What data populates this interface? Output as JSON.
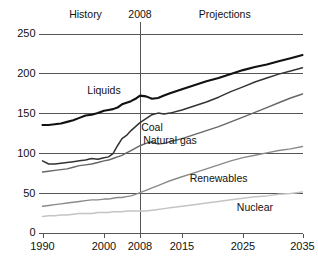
{
  "chart_data": {
    "type": "line",
    "title": "",
    "xlabel": "",
    "ylabel": "",
    "xlim": [
      1990,
      2035
    ],
    "ylim": [
      0,
      250
    ],
    "grid": true,
    "legend_position": "inline-series-labels",
    "xticks": [
      1990,
      2000,
      2008,
      2015,
      2025,
      2035
    ],
    "xtick_labels": [
      "1990",
      "2000",
      "2008",
      "2015",
      "2025",
      "2035"
    ],
    "yticks": [
      0,
      50,
      100,
      150,
      200,
      250
    ],
    "ytick_labels": [
      "0",
      "50",
      "100",
      "150",
      "200",
      "250"
    ],
    "annotations": [
      {
        "text": "History",
        "x": 1997,
        "position": "top"
      },
      {
        "text": "2008",
        "x": 2008,
        "position": "top"
      },
      {
        "text": "Projections",
        "x": 2022,
        "position": "top"
      }
    ],
    "divider_year": 2008,
    "series": [
      {
        "name": "Liquids",
        "color": "#111111",
        "width": 2.1,
        "label_x": 2000,
        "label_y": 178,
        "x": [
          1990,
          1991,
          1992,
          1993,
          1994,
          1995,
          1996,
          1997,
          1998,
          1999,
          2000,
          2001,
          2002,
          2003,
          2004,
          2005,
          2006,
          2007,
          2008,
          2009,
          2010,
          2011,
          2012,
          2013,
          2015,
          2017,
          2019,
          2021,
          2023,
          2025,
          2027,
          2029,
          2031,
          2033,
          2035
        ],
        "values": [
          135,
          135,
          136,
          137,
          139,
          141,
          144,
          147,
          148,
          150,
          153,
          154,
          155,
          157,
          161,
          163,
          165,
          168,
          172,
          171,
          168,
          169,
          172,
          175,
          180,
          185,
          190,
          194,
          199,
          204,
          208,
          211,
          215,
          219,
          223
        ]
      },
      {
        "name": "Coal",
        "color": "#333333",
        "width": 1.5,
        "label_x": 2010,
        "label_y": 132,
        "x": [
          1990,
          1991,
          1992,
          1993,
          1994,
          1995,
          1996,
          1997,
          1998,
          1999,
          2000,
          2001,
          2002,
          2003,
          2004,
          2005,
          2006,
          2007,
          2008,
          2009,
          2010,
          2011,
          2012,
          2013,
          2015,
          2017,
          2019,
          2021,
          2023,
          2025,
          2027,
          2029,
          2031,
          2033,
          2035
        ],
        "values": [
          90,
          86,
          86,
          87,
          88,
          89,
          90,
          91,
          93,
          92,
          94,
          95,
          99,
          109,
          118,
          122,
          128,
          133,
          138,
          143,
          148,
          150,
          149,
          150,
          154,
          159,
          164,
          170,
          177,
          183,
          189,
          194,
          199,
          203,
          207
        ]
      },
      {
        "name": "Natural gas",
        "color": "#666666",
        "width": 1.4,
        "label_x": 2013,
        "label_y": 116,
        "x": [
          1990,
          1991,
          1992,
          1993,
          1994,
          1995,
          1996,
          1997,
          1998,
          1999,
          2000,
          2001,
          2002,
          2003,
          2004,
          2005,
          2006,
          2007,
          2008,
          2009,
          2010,
          2011,
          2012,
          2013,
          2015,
          2017,
          2019,
          2021,
          2023,
          2025,
          2027,
          2029,
          2031,
          2033,
          2035
        ],
        "values": [
          76,
          77,
          78,
          79,
          80,
          82,
          84,
          85,
          86,
          88,
          90,
          91,
          93,
          95,
          97,
          100,
          103,
          106,
          109,
          112,
          114,
          111,
          112,
          114,
          118,
          123,
          128,
          133,
          139,
          145,
          151,
          157,
          163,
          169,
          174
        ]
      },
      {
        "name": "Renewables",
        "color": "#8a8a8a",
        "width": 1.4,
        "label_x": 2021,
        "label_y": 68,
        "x": [
          1990,
          1991,
          1992,
          1993,
          1994,
          1995,
          1996,
          1997,
          1998,
          1999,
          2000,
          2001,
          2002,
          2003,
          2004,
          2005,
          2006,
          2007,
          2008,
          2009,
          2010,
          2011,
          2012,
          2013,
          2015,
          2017,
          2019,
          2021,
          2023,
          2025,
          2027,
          2029,
          2031,
          2033,
          2035
        ],
        "values": [
          33,
          34,
          35,
          36,
          37,
          38,
          39,
          40,
          41,
          41,
          42,
          42,
          43,
          44,
          44,
          45,
          46,
          48,
          50,
          53,
          56,
          59,
          62,
          65,
          70,
          75,
          80,
          85,
          90,
          94,
          97,
          100,
          103,
          105,
          108
        ]
      },
      {
        "name": "Nuclear",
        "color": "#c4c4c4",
        "width": 1.5,
        "label_x": 2027,
        "label_y": 32,
        "x": [
          1990,
          1991,
          1992,
          1993,
          1994,
          1995,
          1996,
          1997,
          1998,
          1999,
          2000,
          2001,
          2002,
          2003,
          2004,
          2005,
          2006,
          2007,
          2008,
          2009,
          2010,
          2011,
          2012,
          2013,
          2015,
          2017,
          2019,
          2021,
          2023,
          2025,
          2027,
          2029,
          2031,
          2033,
          2035
        ],
        "values": [
          20,
          21,
          21,
          22,
          22,
          23,
          24,
          24,
          24,
          25,
          25,
          25,
          26,
          26,
          26,
          27,
          27,
          27,
          27,
          27,
          28,
          29,
          30,
          31,
          33,
          35,
          37,
          39,
          41,
          43,
          45,
          46,
          48,
          49,
          51
        ]
      }
    ]
  }
}
